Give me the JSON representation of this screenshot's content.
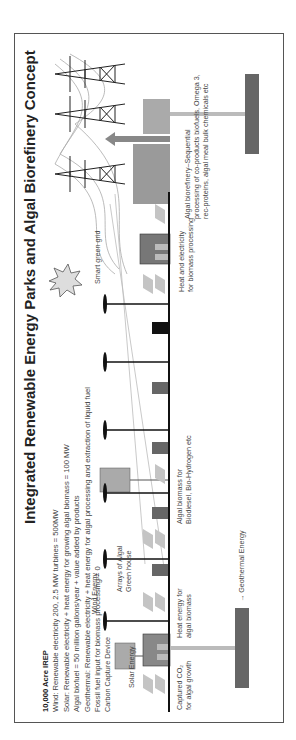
{
  "diagram": {
    "title": "Integrated Renewable Energy Parks and Algal Biorefinery Concept",
    "info": {
      "heading": "10,000 Acre IREP",
      "lines": [
        "Wind: Renewable electricity 200, 2.5 MW turbines = 500MW",
        "Solar: Renewable electricity + heat energy for growing algal biomass = 100 MW",
        "Algal biofuel = 50 million gallons/year + value added by products",
        "Geothermal: Renewable electricity + heat energy for algal processing and extraction of liquid fuel",
        "Fossil fuel input for biomass processing = 0"
      ]
    },
    "labels": {
      "carbon_capture": "Carbon Capture Device",
      "solar_energy": "Solar Energy",
      "captured_co2": "Captured CO₂",
      "captured_co2_2": "for algal growth",
      "heat_energy": "Heat energy for",
      "heat_energy_2": "algal biomass",
      "wind_energy": "Wind Energy",
      "arrays": "Arrays of Algal",
      "arrays_2": "Green house",
      "algal_biomass": "Algal biomass for",
      "algal_biomass_2": "Biodiesel, Bio-Hydrogen etc",
      "geothermal": "→ Geothermal Energy",
      "smart_grid": "Smart green grid",
      "heat_electricity": "Heat and electricity",
      "heat_electricity_2": "for biomass processing",
      "biorefinery": "Algal biorefinery–Sequential",
      "biorefinery_2": "processing of co-products biofuels, Omega 3,",
      "biorefinery_3": "rec-proteins, algal meal bulk chemicals etc"
    },
    "colors": {
      "ground": "#111111",
      "panel": "#bdbdbd",
      "building": "#9a9a9a",
      "geothermal": "#555555"
    }
  }
}
